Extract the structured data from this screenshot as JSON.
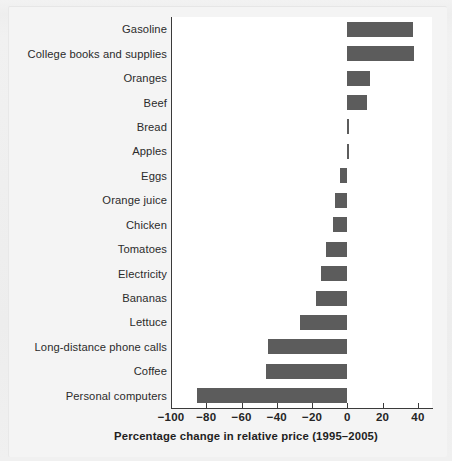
{
  "chart_data": {
    "type": "bar",
    "orientation": "horizontal",
    "title": "",
    "xlabel": "Percentage change in relative price (1995–2005)",
    "ylabel": "",
    "xlim": [
      -100,
      48
    ],
    "xticks": [
      -100,
      -80,
      -60,
      -40,
      -20,
      0,
      20,
      40
    ],
    "xtick_labels": [
      "−100",
      "−80",
      "−60",
      "−40",
      "−20",
      "0",
      "20",
      "40"
    ],
    "grid": false,
    "legend": null,
    "bar_color": "#5c5c5c",
    "panel_color": "#ffffff",
    "axis_color": "#3a3a3a",
    "categories": [
      "Gasoline",
      "College books and supplies",
      "Oranges",
      "Beef",
      "Bread",
      "Apples",
      "Eggs",
      "Orange juice",
      "Chicken",
      "Tomatoes",
      "Electricity",
      "Bananas",
      "Lettuce",
      "Long-distance phone calls",
      "Coffee",
      "Personal computers"
    ],
    "values": [
      37,
      38,
      13,
      11,
      1,
      1,
      -4,
      -7,
      -8,
      -12,
      -15,
      -18,
      -27,
      -45,
      -46,
      -85
    ]
  },
  "figure": {
    "background": "#f0f0f0",
    "paper": "#f4f4f4"
  }
}
